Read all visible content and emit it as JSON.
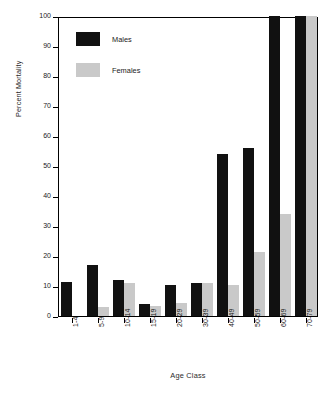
{
  "chart_data": {
    "type": "bar",
    "title": "",
    "xlabel": "Age Class",
    "ylabel": "Percent Mortality",
    "categories": [
      "1-4",
      "5-9",
      "10-14",
      "15-19",
      "20-29",
      "30-39",
      "40-49",
      "50-59",
      "60-69",
      "70-79"
    ],
    "series": [
      {
        "name": "Males",
        "color": "#111111",
        "values": [
          11.5,
          17,
          12,
          4,
          10.5,
          11,
          54,
          56,
          100,
          100
        ]
      },
      {
        "name": "Females",
        "color": "#c9c9c9",
        "values": [
          0,
          3,
          11,
          3.5,
          4.5,
          11,
          10.5,
          21.5,
          34,
          100
        ]
      }
    ],
    "ylim": [
      0,
      100
    ],
    "y_ticks": [
      0,
      10,
      20,
      30,
      40,
      50,
      60,
      70,
      80,
      90,
      100
    ],
    "grid": false,
    "legend_position": "top-left",
    "legend": [
      "Males",
      "Females"
    ]
  },
  "legend": {
    "items": [
      {
        "label": "Males",
        "swatch": "male"
      },
      {
        "label": "Females",
        "swatch": "female"
      }
    ]
  },
  "axes": {
    "x_title": "Age Class",
    "y_title": "Percent Mortality"
  }
}
